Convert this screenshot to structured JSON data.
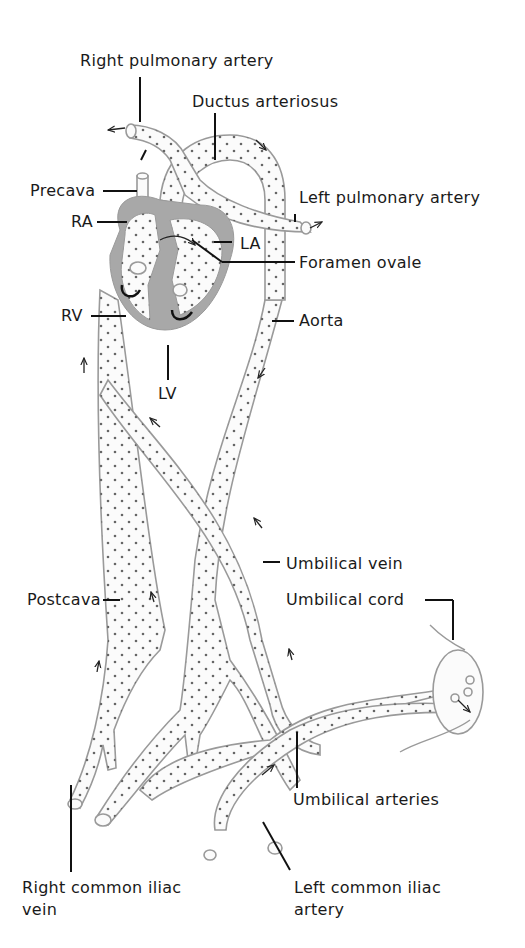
{
  "diagram": {
    "colors": {
      "vessel_outline": "#9a9a9a",
      "heart_wall": "#a8a8a8",
      "text": "#1a1a1a",
      "background": "#ffffff"
    },
    "labels": {
      "right_pulmonary_artery": "Right pulmonary artery",
      "ductus_arteriosus": "Ductus arteriosus",
      "precava": "Precava",
      "left_pulmonary_artery": "Left pulmonary artery",
      "ra": "RA",
      "la": "LA",
      "foramen_ovale": "Foramen ovale",
      "rv": "RV",
      "aorta": "Aorta",
      "lv": "LV",
      "umbilical_vein": "Umbilical vein",
      "postcava": "Postcava",
      "umbilical_cord": "Umbilical cord",
      "umbilical_arteries": "Umbilical arteries",
      "right_common_iliac_vein_l1": "Right common iliac",
      "right_common_iliac_vein_l2": "vein",
      "left_common_iliac_artery_l1": "Left common iliac",
      "left_common_iliac_artery_l2": "artery"
    }
  }
}
